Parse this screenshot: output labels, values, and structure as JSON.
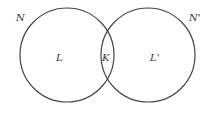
{
  "diagram": {
    "type": "venn",
    "sets": [
      {
        "outer_label": "N",
        "region_label": "L"
      },
      {
        "outer_label": "N'",
        "region_label": "L'"
      }
    ],
    "intersection_label": "K",
    "stroke_color": "#444444"
  }
}
